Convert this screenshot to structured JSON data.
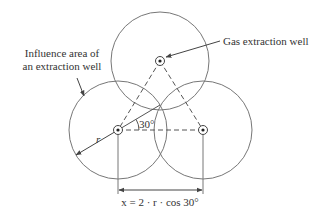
{
  "labels": {
    "influence_line1": "Influence area of",
    "influence_line2": "an extraction well",
    "gas_well": "Gas extraction well",
    "radius": "r",
    "angle": "30°",
    "formula": "x = 2 · r · cos 30°"
  },
  "colors": {
    "line": "#777777",
    "text": "#333333",
    "background": "#ffffff"
  },
  "geometry": {
    "wells": [
      {
        "name": "top",
        "cx": 160,
        "cy": 61
      },
      {
        "name": "left",
        "cx": 118,
        "cy": 130
      },
      {
        "name": "right",
        "cx": 203,
        "cy": 130
      }
    ],
    "influence_radius": 49,
    "angle_deg": 30
  }
}
